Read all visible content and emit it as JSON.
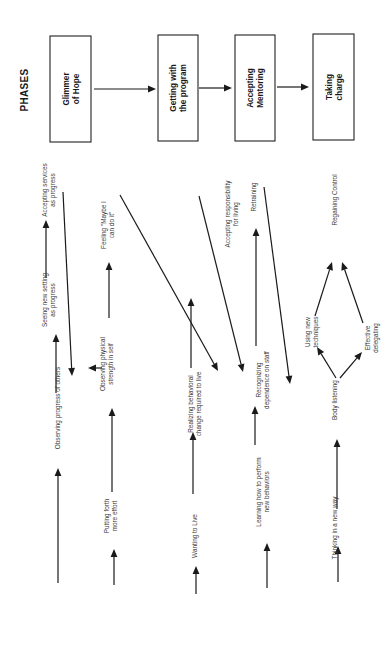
{
  "title": "PHASES",
  "phases": [
    {
      "id": "glimmer",
      "lines": [
        "Glimmer",
        "of Hope"
      ]
    },
    {
      "id": "getting",
      "lines": [
        "Getting with",
        "the program"
      ]
    },
    {
      "id": "accepting",
      "lines": [
        "Accepting",
        "Mentoring"
      ]
    },
    {
      "id": "taking",
      "lines": [
        "Taking",
        "charge"
      ]
    }
  ],
  "nodes": {
    "observing_progress": [
      "Observing progress of others"
    ],
    "seeing_setting": [
      "Seeing new setting",
      "as progress"
    ],
    "accepting_services": [
      "Accepting   services",
      "as progress"
    ],
    "putting_forth": [
      "Putting forth",
      "more effort"
    ],
    "observing_strength": [
      "Observing    physical",
      "strength in self"
    ],
    "feeling_maybe": [
      "Feeling  \"Maybe I",
      "can do it\""
    ],
    "wanting_live": [
      "Wanting to Live"
    ],
    "realizing_change": [
      "Realizing behavioral",
      "change required to live"
    ],
    "accepting_responsibility": [
      "Accepting responsibility",
      "for living"
    ],
    "learning_perform": [
      "Learning how  to perform",
      "new behaviors"
    ],
    "recognizing_dependence": [
      "Recognizing",
      "dependence on staff"
    ],
    "retraining": [
      "Retraining"
    ],
    "thinking_new": [
      "Thinking in a new way"
    ],
    "body_listening": [
      "Body listening"
    ],
    "using_techniques": [
      "Using  new",
      "techniques"
    ],
    "effective_delegating": [
      "Effective",
      "delegating"
    ],
    "regaining_control": [
      "Regaining Control"
    ]
  }
}
